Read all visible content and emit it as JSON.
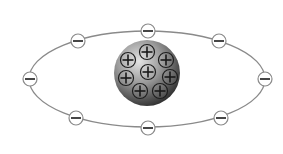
{
  "diagram": {
    "colors": {
      "background": "#ffffff",
      "orbit": "#8a8a8a",
      "electron_fill": "#ffffff",
      "electron_stroke": "#8a8a8a",
      "sign": "#333333",
      "nucleus_light": "#d8d8d8",
      "nucleus_dark": "#2a2a2a"
    },
    "orbit": {
      "cx": 147,
      "cy": 79,
      "rx": 118,
      "ry": 48
    },
    "nucleus": {
      "cx": 147,
      "cy": 73,
      "r": 33,
      "protons": [
        {
          "x": 147,
          "y": 52
        },
        {
          "x": 128,
          "y": 60
        },
        {
          "x": 166,
          "y": 60
        },
        {
          "x": 126,
          "y": 78
        },
        {
          "x": 148,
          "y": 72
        },
        {
          "x": 170,
          "y": 77
        },
        {
          "x": 140,
          "y": 91
        },
        {
          "x": 160,
          "y": 91
        }
      ],
      "proton_symbol": "+"
    },
    "electrons": [
      {
        "x": 148,
        "y": 31
      },
      {
        "x": 78,
        "y": 41
      },
      {
        "x": 219,
        "y": 41
      },
      {
        "x": 30,
        "y": 79
      },
      {
        "x": 265,
        "y": 79
      },
      {
        "x": 76,
        "y": 118
      },
      {
        "x": 221,
        "y": 118
      },
      {
        "x": 148,
        "y": 128
      }
    ],
    "electron_symbol": "−",
    "counts": {
      "protons": 8,
      "electrons": 8
    }
  }
}
